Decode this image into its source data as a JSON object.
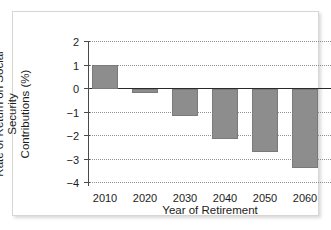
{
  "figure": {
    "background_color": "#ffffff",
    "frame_color": "#d8d6d2",
    "bar_color": "#8d8d8d",
    "gridline_color": "#8f8f8f",
    "axis_color": "#4a4a4a"
  },
  "chart_data": {
    "type": "bar",
    "title": "",
    "xlabel": "Year of Retirement",
    "ylabel": "Rate of Return on Social Security Contributions (%)",
    "ylabel_line1": "Rate of Return on Social Security",
    "ylabel_line2": "Contributions (%)",
    "categories": [
      "2010",
      "2020",
      "2030",
      "2040",
      "2050",
      "2060"
    ],
    "values": [
      1.0,
      -0.17,
      -1.1,
      -2.05,
      -2.6,
      -3.25
    ],
    "ylim": [
      -4,
      2
    ],
    "yticks": [
      2,
      1,
      0,
      -1,
      -2,
      -3,
      -4
    ],
    "ytick_labels": [
      "2",
      "1",
      "0",
      "−1",
      "−2",
      "−3",
      "−4"
    ],
    "grid": true,
    "grid_style": "dotted-horizontal",
    "legend": "none",
    "series": [
      {
        "name": "Rate of Return on Social Security Contributions (%)",
        "values": [
          1.0,
          -0.17,
          -1.1,
          -2.05,
          -2.6,
          -3.25
        ]
      }
    ]
  }
}
